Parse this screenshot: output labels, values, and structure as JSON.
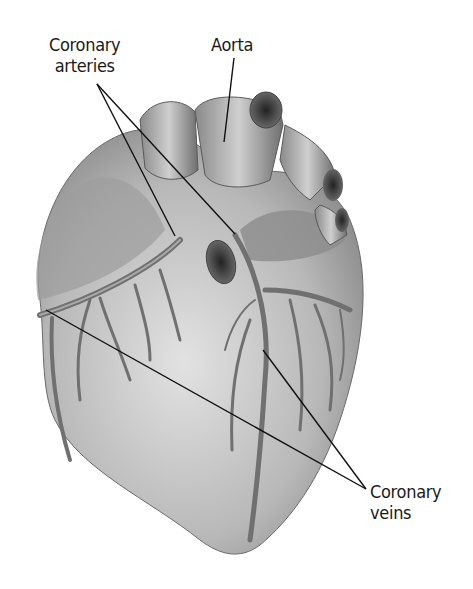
{
  "diagram": {
    "labels": {
      "coronary_arteries": {
        "line1": "Coronary",
        "line2": "arteries"
      },
      "aorta": {
        "line1": "Aorta"
      },
      "coronary_veins": {
        "line1": "Coronary",
        "line2": "veins"
      }
    },
    "colors": {
      "background": "#ffffff",
      "leader_line": "#111111",
      "heart_light": "#d9d9d9",
      "heart_mid": "#9a9a9a",
      "heart_dark": "#555555"
    }
  }
}
